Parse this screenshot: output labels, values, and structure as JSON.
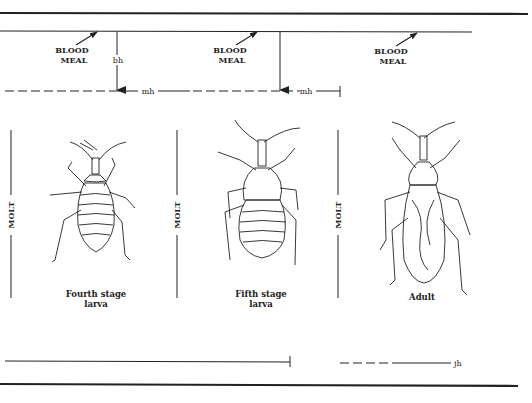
{
  "figure": {
    "blood_meal_labels": [
      {
        "line1": "BLOOD",
        "line2": "MEAL"
      },
      {
        "line1": "BLOOD",
        "line2": "MEAL"
      },
      {
        "line1": "BLOOD",
        "line2": "MEAL"
      }
    ],
    "hormone_labels": {
      "bh": "bh",
      "mh1": "mh",
      "mh2": "mh",
      "jh": "jh"
    },
    "molt_labels": [
      "MOLT",
      "MOLT",
      "MOLT"
    ],
    "stages": [
      {
        "line1": "Fourth stage",
        "line2": "larva"
      },
      {
        "line1": "Fifth stage",
        "line2": "larva"
      },
      {
        "line1": "Adult",
        "line2": ""
      }
    ],
    "colors": {
      "ink": "#222222",
      "background": "#ffffff"
    }
  }
}
